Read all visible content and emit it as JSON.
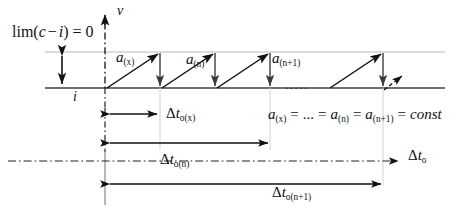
{
  "figure": {
    "type": "diagram",
    "title_text": "",
    "axes": {
      "vertical_axis_label": "v",
      "horizontal_axis_label_delta": "Δ",
      "horizontal_axis_label_t": "t",
      "horizontal_axis_label_sub": "o"
    },
    "limit_expression": {
      "lim": "lim",
      "open": "(",
      "c": "c",
      "minus": "−",
      "i": "i",
      "close": ")",
      "equals": "= 0"
    },
    "baseline_label": "i",
    "acceleration_labels": [
      {
        "symbol": "a",
        "sub": "(x)"
      },
      {
        "symbol": "a",
        "sub": "(n)"
      },
      {
        "symbol": "a",
        "sub": "(n+1)"
      }
    ],
    "ellipsis_between_teeth": ".....",
    "constancy_equation": {
      "a1": "a",
      "a1sub": "(x)",
      "eq1": "=",
      "dots": "...",
      "eq2": "=",
      "a2": "a",
      "a2sub": "(n)",
      "eq3": "=",
      "a3": "a",
      "a3sub": "(n+1)",
      "eq4": "=",
      "const": "const"
    },
    "interval_labels": [
      {
        "delta": "Δ",
        "t": "t",
        "sub": "o(x)"
      },
      {
        "delta": "Δ",
        "t": "t",
        "sub": "o(n)"
      },
      {
        "delta": "Δ",
        "t": "t",
        "sub": "o(n+1)"
      }
    ],
    "colors": {
      "ink": "#111111",
      "gray_line": "#8a8a8a",
      "light_gray": "#b5b5b5",
      "background": "#ffffff"
    },
    "geometry": {
      "baseline_y": 88,
      "topline_y": 52,
      "v_axis_x": 105,
      "tooth_xs": [
        105,
        160,
        215,
        270,
        325,
        380,
        435
      ],
      "amplitude_arrow_x": 62
    }
  }
}
